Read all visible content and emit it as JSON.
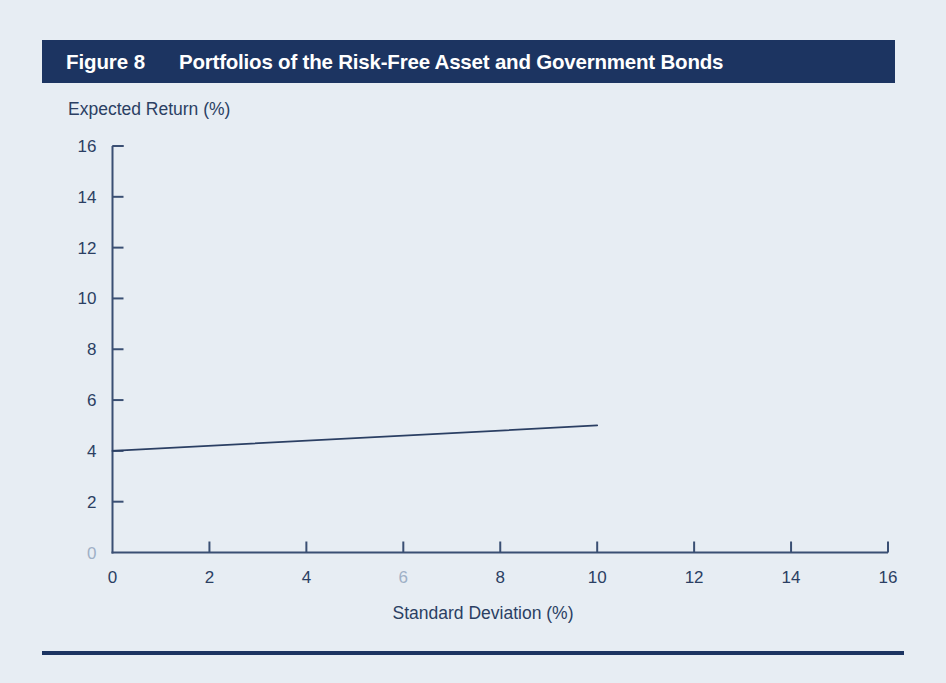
{
  "figure": {
    "number_label": "Figure 8",
    "title": "Portfolios of the Risk-Free Asset and Government Bonds"
  },
  "colors": {
    "page_background": "#e7edf3",
    "title_bar": "#1c3461",
    "title_text": "#ffffff",
    "axis": "#3a4f73",
    "series_line": "#2b3f63",
    "tick_text": "#2b3f63",
    "tick_text_faint": "#9fb0c6",
    "bottom_rule": "#1c3461"
  },
  "chart_data": {
    "type": "line",
    "title": "Portfolios of the Risk-Free Asset and Government Bonds",
    "xlabel": "Standard Deviation (%)",
    "ylabel": "Expected Return (%)",
    "xlim": [
      0,
      16
    ],
    "ylim": [
      0,
      16
    ],
    "xticks": [
      0,
      2,
      4,
      6,
      8,
      10,
      12,
      14,
      16
    ],
    "xtick_labels": [
      "0",
      "2",
      "4",
      "6",
      "8",
      "10",
      "12",
      "14",
      "16"
    ],
    "yticks": [
      0,
      2,
      4,
      6,
      8,
      10,
      12,
      14,
      16
    ],
    "ytick_labels": [
      "0",
      "2",
      "4",
      "6",
      "8",
      "10",
      "12",
      "14",
      "16"
    ],
    "grid": false,
    "legend": null,
    "series": [
      {
        "name": "Risk-free asset and government bonds portfolio line",
        "x": [
          0,
          10
        ],
        "y": [
          4,
          5
        ],
        "points": [
          [
            0,
            4
          ],
          [
            10,
            5
          ]
        ]
      }
    ],
    "annotations": []
  }
}
